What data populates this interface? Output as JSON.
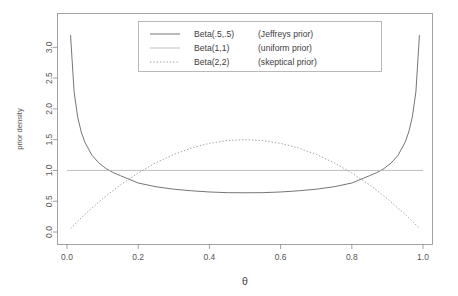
{
  "chart_data": {
    "type": "line",
    "title": "",
    "xlabel": "θ",
    "ylabel": "prior density",
    "xlim": [
      0.0,
      1.0
    ],
    "ylim": [
      0.0,
      3.2
    ],
    "grid": false,
    "legend_position": "top-center",
    "xticks": [
      0.0,
      0.2,
      0.4,
      0.6,
      0.8,
      1.0
    ],
    "xtick_labels": [
      "0.0",
      "0.2",
      "0.4",
      "0.6",
      "0.8",
      "1.0"
    ],
    "yticks": [
      0.0,
      0.5,
      1.0,
      1.5,
      2.0,
      2.5,
      3.0
    ],
    "ytick_labels": [
      "0.0",
      "0.5",
      "1.0",
      "1.5",
      "2.0",
      "2.5",
      "3.0"
    ],
    "series": [
      {
        "name": "Beta(.5,.5)",
        "legend_label": "Beta(.5,.5)",
        "legend_note": "(Jeffreys prior)",
        "style": "solid",
        "color": "#6e6e6e",
        "distribution": "beta",
        "a": 0.5,
        "b": 0.5,
        "x": [
          0.01,
          0.02,
          0.03,
          0.04,
          0.05,
          0.07,
          0.09,
          0.11,
          0.13,
          0.15,
          0.2,
          0.25,
          0.3,
          0.35,
          0.4,
          0.45,
          0.5,
          0.55,
          0.6,
          0.65,
          0.7,
          0.75,
          0.8,
          0.85,
          0.87,
          0.89,
          0.91,
          0.93,
          0.95,
          0.96,
          0.97,
          0.98,
          0.99
        ],
        "values": [
          3.198,
          2.274,
          1.866,
          1.625,
          1.46,
          1.247,
          1.118,
          1.029,
          0.964,
          0.915,
          0.796,
          0.735,
          0.695,
          0.669,
          0.65,
          0.639,
          0.637,
          0.639,
          0.65,
          0.669,
          0.695,
          0.735,
          0.796,
          0.915,
          0.964,
          1.029,
          1.118,
          1.247,
          1.46,
          1.625,
          1.866,
          2.274,
          3.198
        ]
      },
      {
        "name": "Beta(1,1)",
        "legend_label": "Beta(1,1)",
        "legend_note": "(uniform prior)",
        "style": "solid",
        "color": "#b4b4b4",
        "distribution": "beta",
        "a": 1,
        "b": 1,
        "x": [
          0.0,
          1.0
        ],
        "values": [
          1.0,
          1.0
        ]
      },
      {
        "name": "Beta(2,2)",
        "legend_label": "Beta(2,2)",
        "legend_note": "(skeptical prior)",
        "style": "dotted",
        "color": "#9e9e9e",
        "distribution": "beta",
        "a": 2,
        "b": 2,
        "x": [
          0.01,
          0.05,
          0.1,
          0.15,
          0.2,
          0.25,
          0.3,
          0.35,
          0.4,
          0.45,
          0.5,
          0.55,
          0.6,
          0.65,
          0.7,
          0.75,
          0.8,
          0.85,
          0.9,
          0.95,
          0.99
        ],
        "values": [
          0.059,
          0.285,
          0.54,
          0.765,
          0.96,
          1.125,
          1.26,
          1.365,
          1.44,
          1.485,
          1.5,
          1.485,
          1.44,
          1.365,
          1.26,
          1.125,
          0.96,
          0.765,
          0.54,
          0.285,
          0.059
        ]
      }
    ]
  }
}
